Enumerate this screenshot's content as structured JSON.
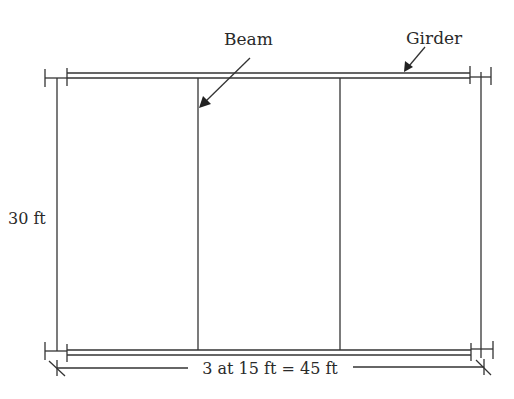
{
  "diagram": {
    "type": "structural-framing-plan",
    "labels": {
      "beam": "Beam",
      "girder": "Girder",
      "height_dimension": "30 ft",
      "width_dimension": "3 at 15 ft = 45 ft"
    },
    "bays": 3,
    "bay_width": "15 ft",
    "total_width": "45 ft",
    "depth": "30 ft",
    "colors": {
      "line": "#333333",
      "text": "#2a2a2a",
      "background": "#ffffff"
    }
  }
}
